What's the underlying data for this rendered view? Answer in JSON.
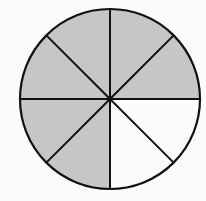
{
  "diagram": {
    "type": "fraction-circle",
    "total_parts": 8,
    "shaded_parts": 6,
    "unshaded_parts": 2,
    "fraction_shaded": "6/8",
    "center": [
      110,
      99
    ],
    "radius": 90,
    "colors": {
      "shaded": "#c6c6c6",
      "unshaded": "#fbfbfb",
      "stroke": "#111111",
      "background": "#fbfbfb"
    },
    "sectors": [
      {
        "index": 0,
        "from_deg": 0,
        "to_deg": 45,
        "shaded": false,
        "position": "right-lower"
      },
      {
        "index": 1,
        "from_deg": 45,
        "to_deg": 90,
        "shaded": false,
        "position": "bottom-right"
      },
      {
        "index": 2,
        "from_deg": 90,
        "to_deg": 135,
        "shaded": true,
        "position": "bottom-left"
      },
      {
        "index": 3,
        "from_deg": 135,
        "to_deg": 180,
        "shaded": true,
        "position": "left-lower"
      },
      {
        "index": 4,
        "from_deg": 180,
        "to_deg": 225,
        "shaded": true,
        "position": "left-upper"
      },
      {
        "index": 5,
        "from_deg": 225,
        "to_deg": 270,
        "shaded": true,
        "position": "top-left"
      },
      {
        "index": 6,
        "from_deg": 270,
        "to_deg": 315,
        "shaded": true,
        "position": "top-right"
      },
      {
        "index": 7,
        "from_deg": 315,
        "to_deg": 360,
        "shaded": true,
        "position": "right-upper"
      }
    ]
  }
}
